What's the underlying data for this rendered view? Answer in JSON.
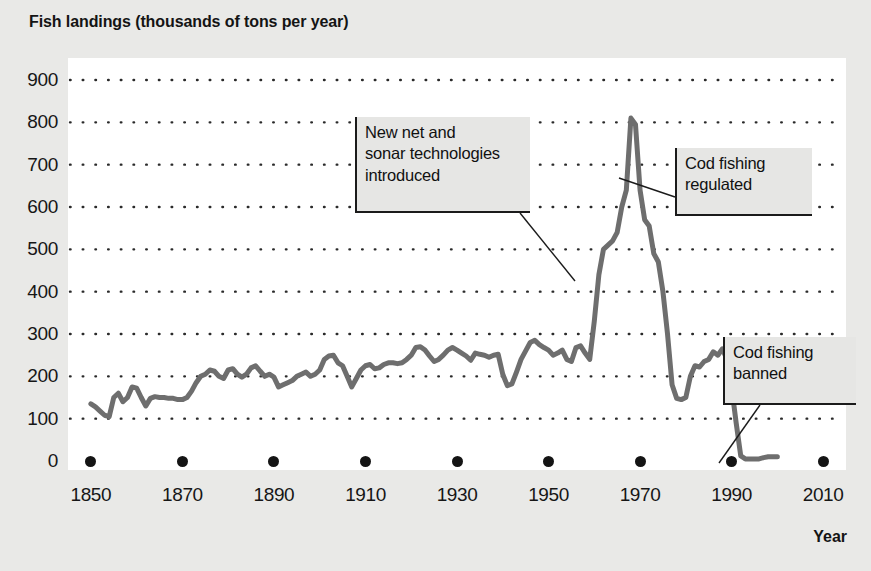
{
  "chart_data": {
    "type": "line",
    "title": "Fish landings (thousands of tons per year)",
    "xlabel": "Year",
    "ylabel": "",
    "xlim": [
      1845,
      2015
    ],
    "ylim": [
      0,
      900
    ],
    "grid": "dotted-horizontal",
    "legend": "none",
    "series_color": "#6e6e6e",
    "x_ticks": [
      "1850",
      "1870",
      "1890",
      "1910",
      "1930",
      "1950",
      "1970",
      "1990",
      "2010"
    ],
    "y_ticks": [
      "0",
      "100",
      "200",
      "300",
      "400",
      "500",
      "600",
      "700",
      "800",
      "900"
    ],
    "series": [
      {
        "name": "Fish landings",
        "x": [
          1850,
          1851,
          1852,
          1853,
          1854,
          1855,
          1856,
          1857,
          1858,
          1859,
          1860,
          1861,
          1862,
          1863,
          1864,
          1865,
          1866,
          1867,
          1868,
          1869,
          1870,
          1871,
          1872,
          1873,
          1874,
          1875,
          1876,
          1877,
          1878,
          1879,
          1880,
          1881,
          1882,
          1883,
          1884,
          1885,
          1886,
          1887,
          1888,
          1889,
          1890,
          1891,
          1892,
          1893,
          1894,
          1895,
          1896,
          1897,
          1898,
          1899,
          1900,
          1901,
          1902,
          1903,
          1904,
          1905,
          1906,
          1907,
          1908,
          1909,
          1910,
          1911,
          1912,
          1913,
          1914,
          1915,
          1916,
          1917,
          1918,
          1919,
          1920,
          1921,
          1922,
          1923,
          1924,
          1925,
          1926,
          1927,
          1928,
          1929,
          1930,
          1931,
          1932,
          1933,
          1934,
          1935,
          1936,
          1937,
          1938,
          1939,
          1940,
          1941,
          1942,
          1943,
          1944,
          1945,
          1946,
          1947,
          1948,
          1949,
          1950,
          1951,
          1952,
          1953,
          1954,
          1955,
          1956,
          1957,
          1958,
          1959,
          1960,
          1961,
          1962,
          1963,
          1964,
          1965,
          1966,
          1967,
          1968,
          1969,
          1970,
          1971,
          1972,
          1973,
          1974,
          1975,
          1976,
          1977,
          1978,
          1979,
          1980,
          1981,
          1982,
          1983,
          1984,
          1985,
          1986,
          1987,
          1988,
          1989,
          1990,
          1991,
          1992,
          1993,
          1994,
          1995,
          1996,
          1997,
          1998,
          1999,
          2000
        ],
        "values": [
          135,
          128,
          118,
          108,
          105,
          150,
          160,
          140,
          150,
          175,
          172,
          150,
          130,
          148,
          152,
          150,
          150,
          148,
          148,
          145,
          145,
          150,
          165,
          185,
          200,
          205,
          215,
          212,
          200,
          195,
          215,
          218,
          205,
          198,
          205,
          220,
          225,
          212,
          200,
          205,
          198,
          175,
          180,
          185,
          190,
          200,
          205,
          210,
          200,
          205,
          215,
          240,
          248,
          250,
          232,
          225,
          200,
          175,
          195,
          215,
          225,
          228,
          218,
          220,
          228,
          232,
          232,
          230,
          232,
          240,
          250,
          268,
          270,
          262,
          248,
          235,
          240,
          250,
          262,
          268,
          262,
          255,
          248,
          238,
          255,
          252,
          250,
          245,
          250,
          252,
          205,
          178,
          182,
          210,
          240,
          260,
          280,
          285,
          275,
          268,
          262,
          250,
          255,
          262,
          240,
          235,
          268,
          272,
          255,
          240,
          330,
          440,
          500,
          510,
          520,
          540,
          600,
          640,
          810,
          795,
          640,
          570,
          555,
          490,
          470,
          400,
          300,
          180,
          148,
          145,
          150,
          200,
          225,
          222,
          235,
          240,
          258,
          250,
          265,
          240,
          175,
          90,
          12,
          5,
          5,
          5,
          5,
          8,
          10,
          10,
          10
        ]
      }
    ],
    "annotations": [
      {
        "id": "new-net-sonar",
        "text": "New net and\nsonar technologies\nintroduced",
        "box": {
          "left": 355,
          "top": 117,
          "width": 175,
          "height": 96
        },
        "leader": {
          "x1": 520,
          "y1": 213,
          "x2": 575,
          "y2": 281
        }
      },
      {
        "id": "cod-regulated",
        "text": "Cod fishing\nregulated",
        "box": {
          "left": 675,
          "top": 148,
          "width": 137,
          "height": 68
        },
        "leader": {
          "x1": 675,
          "y1": 197,
          "x2": 619,
          "y2": 178
        }
      },
      {
        "id": "cod-banned",
        "text": "Cod fishing\nbanned",
        "box": {
          "left": 723,
          "top": 337,
          "width": 133,
          "height": 68
        },
        "leader": {
          "x1": 760,
          "y1": 405,
          "x2": 719,
          "y2": 463
        }
      }
    ]
  }
}
